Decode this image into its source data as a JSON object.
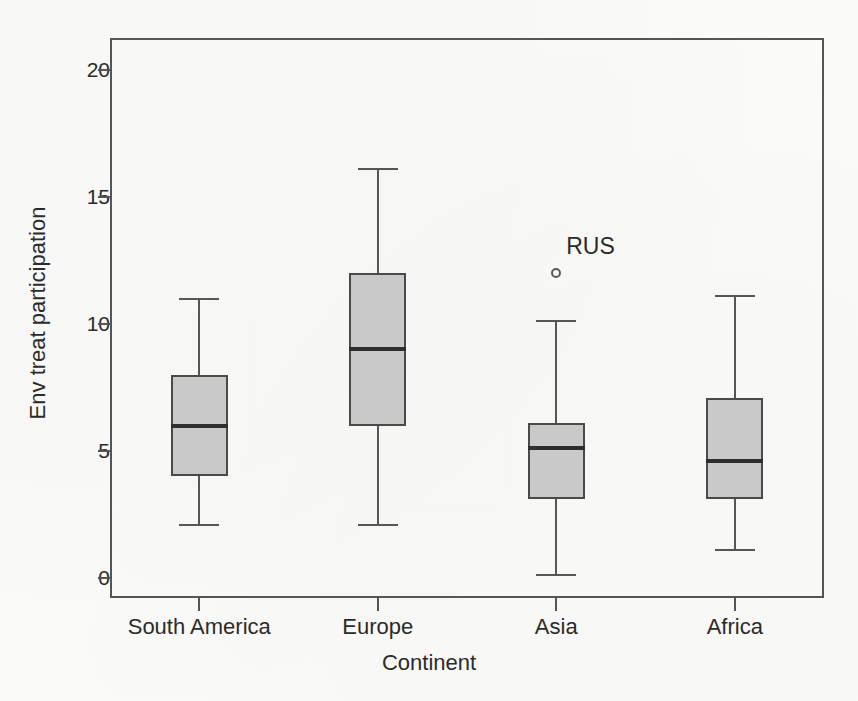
{
  "chart_data": {
    "type": "boxplot",
    "title": "",
    "subtitle": "",
    "xlabel": "Continent",
    "ylabel": "Env treat participation",
    "categories": [
      "South America",
      "Europe",
      "Asia",
      "Africa"
    ],
    "ylim": [
      0,
      21
    ],
    "yticks": [
      0,
      5,
      10,
      15,
      20
    ],
    "ytick_labels": [
      "0",
      "5",
      "10",
      "15",
      "20"
    ],
    "grid": false,
    "legend": "none",
    "box_fill_color": "#c9c9c9",
    "box_edge_color": "#4a4a4a",
    "median_color": "#2e2e2e",
    "whisker_color": "#565656",
    "boxes": [
      {
        "category": "South America",
        "whisker_low": 2.1,
        "q1": 4.0,
        "median": 6.0,
        "q3": 8.0,
        "whisker_high": 11.0,
        "outliers": []
      },
      {
        "category": "Europe",
        "whisker_low": 2.1,
        "q1": 6.0,
        "median": 9.0,
        "q3": 12.0,
        "whisker_high": 16.1,
        "outliers": []
      },
      {
        "category": "Asia",
        "whisker_low": 0.1,
        "q1": 3.1,
        "median": 5.1,
        "q3": 6.1,
        "whisker_high": 10.1,
        "outliers": [
          {
            "label": "RUS",
            "value": 12.0
          }
        ]
      },
      {
        "category": "Africa",
        "whisker_low": 1.1,
        "q1": 3.1,
        "median": 4.6,
        "q3": 7.1,
        "whisker_high": 11.1,
        "outliers": []
      }
    ],
    "annotations": [
      {
        "text": "RUS",
        "category": "Asia",
        "value": 12.0
      }
    ]
  }
}
